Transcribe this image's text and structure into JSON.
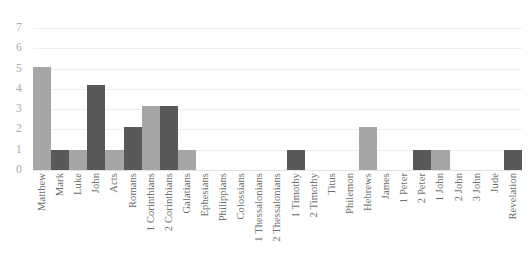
{
  "chart_data": {
    "type": "bar",
    "title": "",
    "subtitle": "",
    "xlabel": "",
    "ylabel": "",
    "ylim": [
      0,
      7
    ],
    "yticks": [
      7,
      6,
      5,
      4,
      3,
      2,
      1,
      0
    ],
    "grid": true,
    "legend": "none",
    "bar_gap": "none",
    "categories": [
      "Matthew",
      "Mark",
      "Luke",
      "John",
      "Acts",
      "Romans",
      "1 Corinthians",
      "2 Corinthians",
      "Galatians",
      "Ephesians",
      "Philippians",
      "Colossians",
      "1 Thessalonians",
      "2 Thessalonians",
      "1 Timothy",
      "2 Timothy",
      "Titus",
      "Philemon",
      "Hebrews",
      "James",
      "1 Peter",
      "2 Peter",
      "1 John",
      "2 John",
      "3 John",
      "Jude",
      "Revelation"
    ],
    "values": [
      5.1,
      1,
      1,
      4.2,
      1,
      2.1,
      3.15,
      3.15,
      1,
      0,
      0,
      0,
      0,
      0,
      1,
      0,
      0,
      0,
      2.1,
      0,
      0,
      1,
      1,
      0,
      0,
      0,
      1
    ],
    "bar_colors": [
      "#a6a6a6",
      "#595959",
      "#a6a6a6",
      "#595959",
      "#a6a6a6",
      "#595959",
      "#a6a6a6",
      "#595959",
      "#a6a6a6",
      "#595959",
      "#a6a6a6",
      "#595959",
      "#a6a6a6",
      "#595959",
      "#595959",
      "#a6a6a6",
      "#595959",
      "#a6a6a6",
      "#a6a6a6",
      "#595959",
      "#a6a6a6",
      "#595959",
      "#a6a6a6",
      "#595959",
      "#a6a6a6",
      "#595959",
      "#595959"
    ]
  },
  "style": {
    "background": "#ffffff",
    "gridline_color": "#eeeeee",
    "axis_text_color": "#a9a9a9",
    "category_text_color": "#6d6d6d",
    "light_bar": "#a6a6a6",
    "dark_bar": "#595959"
  }
}
